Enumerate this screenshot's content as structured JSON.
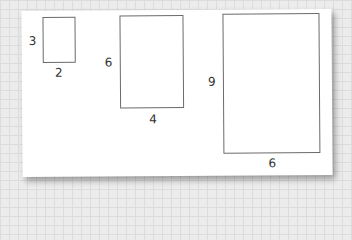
{
  "diagram": {
    "title": "",
    "rectangles": [
      {
        "id": "small",
        "height_label": "3",
        "width_label": "2"
      },
      {
        "id": "medium",
        "height_label": "6",
        "width_label": "4"
      },
      {
        "id": "large",
        "height_label": "9",
        "width_label": "6"
      }
    ]
  }
}
